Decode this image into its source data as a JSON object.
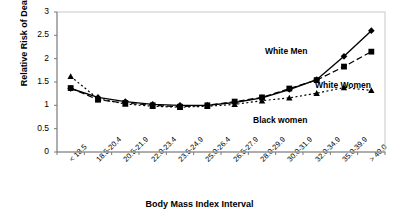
{
  "chart_data": {
    "type": "line",
    "title": "",
    "xlabel": "Body Mass Index Interval",
    "ylabel": "Relative Risk of Death",
    "ylim": [
      0,
      3
    ],
    "ytick_step": 0.5,
    "yticks": [
      "0",
      "0.5",
      "1",
      "1.5",
      "2",
      "2.5",
      "3"
    ],
    "grid": false,
    "legend": "inline-annotations",
    "categories": [
      "< 18.5",
      "18.5-20.4",
      "20.5-21.9",
      "22.0-23.4",
      "23.5-24.9",
      "25.0-26.4",
      "26.5-27.9",
      "28.0-29.9",
      "30.0-31.9",
      "32.0-34.9",
      "35.0-39.9",
      "> 40.0"
    ],
    "series": [
      {
        "name": "White Men",
        "marker": "diamond",
        "line": "solid",
        "color": "#000000",
        "values": [
          1.36,
          1.17,
          1.08,
          1.02,
          1.0,
          1.0,
          1.06,
          1.16,
          1.34,
          1.55,
          2.05,
          2.6
        ]
      },
      {
        "name": "White Women",
        "marker": "square",
        "line": "dashed",
        "color": "#000000",
        "values": [
          1.37,
          1.12,
          1.05,
          1.0,
          0.97,
          1.0,
          1.08,
          1.17,
          1.36,
          1.54,
          1.83,
          2.15
        ]
      },
      {
        "name": "Black women",
        "marker": "triangle",
        "line": "dotted",
        "color": "#000000",
        "values": [
          1.62,
          1.14,
          1.03,
          0.98,
          0.96,
          0.98,
          1.02,
          1.1,
          1.16,
          1.26,
          1.38,
          1.32
        ]
      }
    ],
    "annotations": [
      {
        "text": "White Men",
        "x_px": 265,
        "y_px": 46
      },
      {
        "text": "White Women",
        "x_px": 315,
        "y_px": 80
      },
      {
        "text": "Black women",
        "x_px": 253,
        "y_px": 115
      }
    ]
  },
  "axes": {
    "y_title": "Relative Risk of Death",
    "x_title": "Body Mass Index Interval"
  }
}
